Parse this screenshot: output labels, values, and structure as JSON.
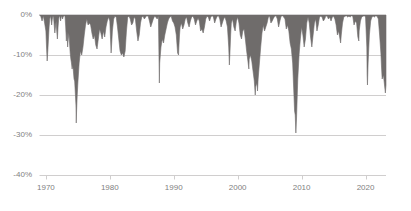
{
  "chart_data": {
    "type": "area",
    "title": "",
    "subtitle": "",
    "xlabel": "",
    "ylabel": "",
    "grid": true,
    "legend": null,
    "legend_position": "none",
    "xlim": [
      1969.0,
      2023.2
    ],
    "ylim": [
      -40,
      0
    ],
    "x_tick_labels": [
      "1970",
      "1980",
      "1990",
      "2000",
      "2010",
      "2020"
    ],
    "x_ticks": [
      1970,
      1980,
      1990,
      2000,
      2010,
      2020
    ],
    "y_tick_labels": [
      "0%",
      "-10%",
      "-20%",
      "-30%",
      "-40%"
    ],
    "y_ticks": [
      0,
      -10,
      -20,
      -30,
      -40
    ],
    "series": [
      {
        "name": "Drawdown",
        "fill_color": "#6f6c6b",
        "x": [
          1969.0,
          1969.2,
          1969.4,
          1969.6,
          1969.8,
          1970.0,
          1970.1,
          1970.2,
          1970.3,
          1970.4,
          1970.5,
          1970.6,
          1970.7,
          1970.8,
          1970.9,
          1971.0,
          1971.1,
          1971.2,
          1971.3,
          1971.4,
          1971.5,
          1971.6,
          1971.7,
          1971.8,
          1971.9,
          1972.0,
          1972.1,
          1972.2,
          1972.3,
          1972.4,
          1972.5,
          1972.6,
          1972.7,
          1972.8,
          1972.9,
          1973.0,
          1973.1,
          1973.2,
          1973.3,
          1973.4,
          1973.5,
          1973.6,
          1973.7,
          1973.8,
          1973.9,
          1974.0,
          1974.1,
          1974.2,
          1974.3,
          1974.4,
          1974.5,
          1974.6,
          1974.7,
          1974.75,
          1974.8,
          1974.9,
          1975.0,
          1975.2,
          1975.4,
          1975.6,
          1975.8,
          1976.0,
          1976.2,
          1976.4,
          1976.6,
          1976.8,
          1977.0,
          1977.2,
          1977.4,
          1977.6,
          1977.8,
          1978.0,
          1978.2,
          1978.4,
          1978.6,
          1978.8,
          1979.0,
          1979.2,
          1979.4,
          1979.6,
          1979.8,
          1980.0,
          1980.1,
          1980.2,
          1980.3,
          1980.4,
          1980.6,
          1980.8,
          1981.0,
          1981.2,
          1981.4,
          1981.6,
          1981.8,
          1982.0,
          1982.2,
          1982.4,
          1982.6,
          1982.8,
          1983.0,
          1983.2,
          1983.4,
          1983.6,
          1983.8,
          1984.0,
          1984.2,
          1984.4,
          1984.6,
          1984.8,
          1985.0,
          1985.2,
          1985.4,
          1985.6,
          1985.8,
          1986.0,
          1986.2,
          1986.4,
          1986.6,
          1986.8,
          1987.0,
          1987.2,
          1987.4,
          1987.6,
          1987.75,
          1987.8,
          1987.9,
          1988.0,
          1988.2,
          1988.4,
          1988.6,
          1988.8,
          1989.0,
          1989.2,
          1989.4,
          1989.6,
          1989.8,
          1990.0,
          1990.2,
          1990.4,
          1990.6,
          1990.75,
          1990.8,
          1990.9,
          1991.0,
          1991.2,
          1991.4,
          1991.6,
          1991.8,
          1992.0,
          1992.2,
          1992.4,
          1992.6,
          1992.8,
          1993.0,
          1993.2,
          1993.4,
          1993.6,
          1993.8,
          1994.0,
          1994.2,
          1994.4,
          1994.6,
          1994.8,
          1995.0,
          1995.2,
          1995.4,
          1995.6,
          1995.8,
          1996.0,
          1996.2,
          1996.4,
          1996.6,
          1996.8,
          1997.0,
          1997.2,
          1997.4,
          1997.6,
          1997.8,
          1998.0,
          1998.2,
          1998.4,
          1998.6,
          1998.7,
          1998.8,
          1998.9,
          1999.0,
          1999.2,
          1999.4,
          1999.6,
          1999.8,
          2000.0,
          2000.2,
          2000.4,
          2000.6,
          2000.8,
          2001.0,
          2001.2,
          2001.4,
          2001.6,
          2001.75,
          2001.8,
          2001.9,
          2002.0,
          2002.2,
          2002.4,
          2002.6,
          2002.75,
          2002.8,
          2002.9,
          2003.0,
          2003.1,
          2003.2,
          2003.4,
          2003.6,
          2003.8,
          2004.0,
          2004.2,
          2004.4,
          2004.6,
          2004.8,
          2005.0,
          2005.2,
          2005.4,
          2005.6,
          2005.8,
          2006.0,
          2006.2,
          2006.4,
          2006.6,
          2006.8,
          2007.0,
          2007.2,
          2007.4,
          2007.6,
          2007.8,
          2008.0,
          2008.2,
          2008.4,
          2008.6,
          2008.8,
          2008.9,
          2009.0,
          2009.1,
          2009.2,
          2009.3,
          2009.4,
          2009.6,
          2009.8,
          2010.0,
          2010.2,
          2010.4,
          2010.6,
          2010.8,
          2011.0,
          2011.2,
          2011.4,
          2011.6,
          2011.8,
          2012.0,
          2012.2,
          2012.4,
          2012.6,
          2012.8,
          2013.0,
          2013.2,
          2013.4,
          2013.6,
          2013.8,
          2014.0,
          2014.2,
          2014.4,
          2014.6,
          2014.8,
          2015.0,
          2015.2,
          2015.4,
          2015.6,
          2015.8,
          2016.0,
          2016.1,
          2016.2,
          2016.4,
          2016.6,
          2016.8,
          2017.0,
          2017.2,
          2017.4,
          2017.6,
          2017.8,
          2018.0,
          2018.2,
          2018.4,
          2018.6,
          2018.8,
          2018.95,
          2019.0,
          2019.2,
          2019.4,
          2019.6,
          2019.8,
          2020.0,
          2020.2,
          2020.25,
          2020.3,
          2020.4,
          2020.6,
          2020.8,
          2021.0,
          2021.2,
          2021.4,
          2021.6,
          2021.8,
          2022.0,
          2022.2,
          2022.4,
          2022.5,
          2022.6,
          2022.8,
          2023.0,
          2023.1,
          2023.2
        ],
        "values": [
          0,
          -0.3,
          -1.5,
          -0.2,
          -2.0,
          -4.0,
          -8.0,
          -11.5,
          -9.0,
          -6.0,
          -3.0,
          -1.0,
          -0.2,
          -1.0,
          -2.5,
          -1.0,
          -0.3,
          -0.5,
          -2.5,
          -4.5,
          -3.0,
          -1.5,
          -4.0,
          -6.0,
          -3.0,
          -1.0,
          -0.2,
          -0.5,
          -1.5,
          -0.5,
          -0.2,
          -1.0,
          -0.5,
          -0.2,
          0,
          -0.5,
          -3.0,
          -6.5,
          -4.0,
          -8.0,
          -6.0,
          -4.5,
          -7.0,
          -9.5,
          -11.0,
          -12.0,
          -13.5,
          -12.5,
          -14.0,
          -16.0,
          -16.5,
          -19.5,
          -22.5,
          -27.0,
          -24.0,
          -20.0,
          -17.0,
          -12.0,
          -9.0,
          -10.0,
          -8.0,
          -5.0,
          -2.5,
          -1.0,
          -2.5,
          -2.0,
          -2.5,
          -4.5,
          -6.0,
          -5.0,
          -7.5,
          -8.5,
          -6.0,
          -3.5,
          -4.5,
          -6.0,
          -4.0,
          -5.5,
          -3.0,
          -1.5,
          -0.5,
          -1.5,
          -5.5,
          -9.5,
          -7.0,
          -4.0,
          -1.0,
          -0.3,
          -0.5,
          -3.0,
          -6.0,
          -9.0,
          -10.0,
          -9.5,
          -10.5,
          -9.0,
          -4.0,
          -0.5,
          -0.3,
          -1.0,
          -2.5,
          -2.0,
          -0.5,
          -1.0,
          -4.0,
          -6.5,
          -5.0,
          -2.0,
          -0.5,
          -0.3,
          -1.0,
          -0.5,
          -0.2,
          -0.3,
          -1.5,
          -3.0,
          -2.0,
          -1.0,
          -0.3,
          -0.5,
          -1.0,
          -0.3,
          -17.0,
          -12.0,
          -10.0,
          -8.0,
          -6.0,
          -7.0,
          -5.0,
          -3.5,
          -2.0,
          -1.0,
          -0.5,
          -0.3,
          -1.5,
          -2.0,
          -3.0,
          -5.0,
          -9.5,
          -10.0,
          -8.0,
          -5.0,
          -3.0,
          -2.0,
          -3.5,
          -2.5,
          -1.0,
          -0.5,
          -2.0,
          -3.0,
          -1.5,
          -0.5,
          -0.3,
          -1.0,
          -2.5,
          -1.5,
          -0.8,
          -1.5,
          -4.0,
          -3.5,
          -4.5,
          -3.0,
          -1.0,
          -0.3,
          -0.5,
          -1.5,
          -0.5,
          -0.2,
          -0.5,
          -2.0,
          -1.0,
          -0.3,
          -0.2,
          -1.0,
          -3.0,
          -2.0,
          -1.0,
          -0.5,
          -1.5,
          -3.0,
          -8.0,
          -12.5,
          -9.0,
          -5.0,
          -2.0,
          -1.0,
          -3.0,
          -4.0,
          -1.5,
          -0.5,
          -2.0,
          -5.0,
          -6.0,
          -4.0,
          -3.5,
          -6.0,
          -9.0,
          -11.5,
          -13.5,
          -11.0,
          -10.5,
          -10.0,
          -11.5,
          -14.0,
          -16.5,
          -20.0,
          -18.0,
          -17.5,
          -17.0,
          -19.0,
          -16.0,
          -12.0,
          -8.0,
          -4.5,
          -2.5,
          -4.0,
          -3.0,
          -2.0,
          -0.5,
          -0.3,
          -2.0,
          -1.5,
          -0.8,
          -0.3,
          -0.2,
          -1.0,
          -3.0,
          -1.5,
          -0.3,
          -0.2,
          -0.5,
          -1.0,
          -3.5,
          -2.5,
          -4.0,
          -7.0,
          -8.5,
          -12.0,
          -20.0,
          -24.0,
          -25.0,
          -29.5,
          -26.0,
          -21.0,
          -16.0,
          -10.0,
          -6.0,
          -3.0,
          -5.0,
          -8.0,
          -6.0,
          -2.0,
          -0.5,
          -2.0,
          -5.5,
          -8.0,
          -5.0,
          -2.0,
          -1.0,
          -4.0,
          -2.5,
          -0.5,
          -0.3,
          -0.5,
          -1.5,
          -1.0,
          -0.2,
          -0.3,
          -1.0,
          -0.5,
          -1.5,
          -0.5,
          -0.3,
          -1.0,
          -2.5,
          -5.0,
          -4.0,
          -6.0,
          -7.0,
          -5.0,
          -2.0,
          -0.5,
          -0.3,
          -0.2,
          -0.5,
          -0.3,
          -0.5,
          -0.2,
          -0.3,
          -2.5,
          -1.5,
          -2.0,
          -5.5,
          -6.5,
          -4.0,
          -1.5,
          -0.5,
          -0.3,
          -0.2,
          -0.5,
          -8.0,
          -15.0,
          -17.5,
          -12.0,
          -5.0,
          -1.5,
          -0.5,
          -0.3,
          -0.5,
          -0.2,
          -0.3,
          -1.0,
          -5.0,
          -9.5,
          -13.0,
          -16.0,
          -15.0,
          -18.0,
          -19.5,
          -17.5
        ]
      }
    ],
    "notable_drawdowns": [
      {
        "label": "1970 bear market",
        "year": 1970.2,
        "value": -11.5
      },
      {
        "label": "1973-74 bear market",
        "year": 1974.75,
        "value": -27.0
      },
      {
        "label": "1987 Black Monday",
        "year": 1987.75,
        "value": -17.0
      },
      {
        "label": "1990 recession",
        "year": 1990.75,
        "value": -10.0
      },
      {
        "label": "1998 LTCM",
        "year": 1998.7,
        "value": -12.5
      },
      {
        "label": "2002 dot-com bottom",
        "year": 2002.75,
        "value": -20.0
      },
      {
        "label": "2009 financial crisis",
        "year": 2009.1,
        "value": -29.5
      },
      {
        "label": "2020 COVID crash",
        "year": 2020.25,
        "value": -17.5
      },
      {
        "label": "2022 bear market",
        "year": 2022.8,
        "value": -19.5
      }
    ]
  },
  "axes": {
    "y_labels": [
      "0%",
      "-10%",
      "-20%",
      "-30%",
      "-40%"
    ],
    "x_labels": [
      "1970",
      "1980",
      "1990",
      "2000",
      "2010",
      "2020"
    ]
  },
  "colors": {
    "series_fill": "#6f6c6b",
    "gridline": "#d0cece",
    "axis_text": "#7f7f7f",
    "background": "#ffffff"
  }
}
